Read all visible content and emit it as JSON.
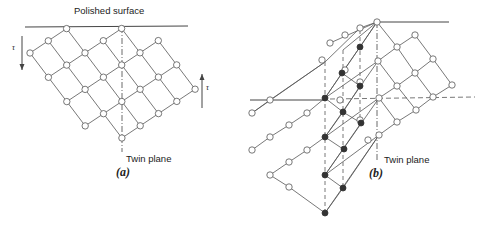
{
  "figure": {
    "panel_a": {
      "label": "(a)",
      "surface_label": "Polished surface",
      "twin_label": "Twin plane",
      "shear_label_left": "τ",
      "shear_label_right": "τ",
      "surface_line": [
        [
          25,
          27
        ],
        [
          188,
          26
        ]
      ],
      "twin_line": [
        [
          122,
          27
        ],
        [
          122,
          152
        ]
      ],
      "twin_label_pos": [
        125,
        157
      ],
      "panel_label_pos": [
        113,
        170
      ],
      "surface_label_pos": [
        74,
        12
      ],
      "arrow_left": {
        "x": 22,
        "y1": 36,
        "y2": 70,
        "dir": "down",
        "label_pos": [
          13,
          48
        ]
      },
      "arrow_right": {
        "x": 202,
        "y1": 108,
        "y2": 74,
        "dir": "up",
        "label_pos": [
          206,
          86
        ]
      },
      "open_nodes": [
        [
          66,
          29
        ],
        [
          122,
          28
        ],
        [
          48,
          41
        ],
        [
          103,
          41
        ],
        [
          158,
          39
        ],
        [
          30,
          53
        ],
        [
          85,
          53
        ],
        [
          140,
          52
        ],
        [
          66,
          65
        ],
        [
          122,
          64
        ],
        [
          175,
          64
        ],
        [
          48,
          77
        ],
        [
          103,
          77
        ],
        [
          158,
          77
        ],
        [
          85,
          90
        ],
        [
          140,
          90
        ],
        [
          193,
          89
        ],
        [
          66,
          102
        ],
        [
          122,
          102
        ],
        [
          175,
          102
        ],
        [
          103,
          115
        ],
        [
          158,
          115
        ],
        [
          85,
          127
        ],
        [
          140,
          127
        ],
        [
          122,
          140
        ]
      ],
      "edges": [
        [
          [
            30,
            53
          ],
          [
            66,
            29
          ]
        ],
        [
          [
            48,
            77
          ],
          [
            122,
            28
          ]
        ],
        [
          [
            66,
            102
          ],
          [
            158,
            39
          ]
        ],
        [
          [
            85,
            127
          ],
          [
            175,
            64
          ]
        ],
        [
          [
            103,
            115
          ],
          [
            193,
            89
          ]
        ],
        [
          [
            122,
            140
          ],
          [
            175,
            102
          ]
        ],
        [
          [
            66,
            102
          ],
          [
            103,
            77
          ]
        ],
        [
          [
            30,
            53
          ],
          [
            122,
            140
          ]
        ],
        [
          [
            48,
            41
          ],
          [
            140,
            127
          ]
        ],
        [
          [
            66,
            29
          ],
          [
            158,
            115
          ]
        ],
        [
          [
            103,
            41
          ],
          [
            193,
            89
          ]
        ],
        [
          [
            122,
            28
          ],
          [
            175,
            102
          ]
        ],
        [
          [
            158,
            39
          ],
          [
            193,
            89
          ]
        ],
        [
          [
            30,
            53
          ],
          [
            85,
            127
          ]
        ],
        [
          [
            48,
            77
          ],
          [
            85,
            127
          ]
        ]
      ]
    },
    "panel_b": {
      "label": "(b)",
      "twin_label": "Twin plane",
      "twin_line": [
        [
          377,
          22
        ],
        [
          377,
          160
        ]
      ],
      "twin_label_pos": [
        381,
        154
      ],
      "panel_label_pos": [
        372,
        167
      ],
      "surface_line_top": [
        [
          377,
          22
        ],
        [
          449,
          22
        ]
      ],
      "surface_line_left": [
        [
          250,
          100
        ],
        [
          325,
          100
        ]
      ],
      "dashed_horizontal": [
        [
          330,
          99
        ],
        [
          475,
          97
        ]
      ],
      "open_nodes": [
        [
          377,
          22
        ],
        [
          415,
          35
        ],
        [
          397,
          47
        ],
        [
          378,
          61
        ],
        [
          433,
          59
        ],
        [
          415,
          73
        ],
        [
          397,
          86
        ],
        [
          452,
          85
        ],
        [
          379,
          98
        ],
        [
          433,
          97
        ],
        [
          416,
          110
        ],
        [
          397,
          122
        ],
        [
          379,
          135
        ],
        [
          270,
          100
        ],
        [
          252,
          113
        ],
        [
          289,
          125
        ],
        [
          307,
          113
        ],
        [
          270,
          137
        ],
        [
          252,
          150
        ],
        [
          307,
          150
        ],
        [
          289,
          162
        ],
        [
          270,
          175
        ],
        [
          289,
          187
        ],
        [
          330,
          43
        ],
        [
          345,
          35
        ],
        [
          360,
          28
        ],
        [
          322,
          60
        ],
        [
          345,
          70
        ],
        [
          360,
          82
        ],
        [
          340,
          100
        ],
        [
          360,
          120
        ],
        [
          368,
          140
        ]
      ],
      "filled_nodes": [
        [
          360,
          47
        ],
        [
          342,
          73
        ],
        [
          325,
          98
        ],
        [
          360,
          86
        ],
        [
          343,
          112
        ],
        [
          325,
          137
        ],
        [
          361,
          123
        ],
        [
          344,
          149
        ],
        [
          325,
          175
        ],
        [
          343,
          188
        ],
        [
          325,
          213
        ]
      ],
      "dashed_verticals": [
        [
          [
            325,
            62
          ],
          [
            325,
            213
          ]
        ],
        [
          [
            343,
            50
          ],
          [
            343,
            188
          ]
        ],
        [
          [
            360,
            30
          ],
          [
            360,
            125
          ]
        ]
      ]
    }
  }
}
